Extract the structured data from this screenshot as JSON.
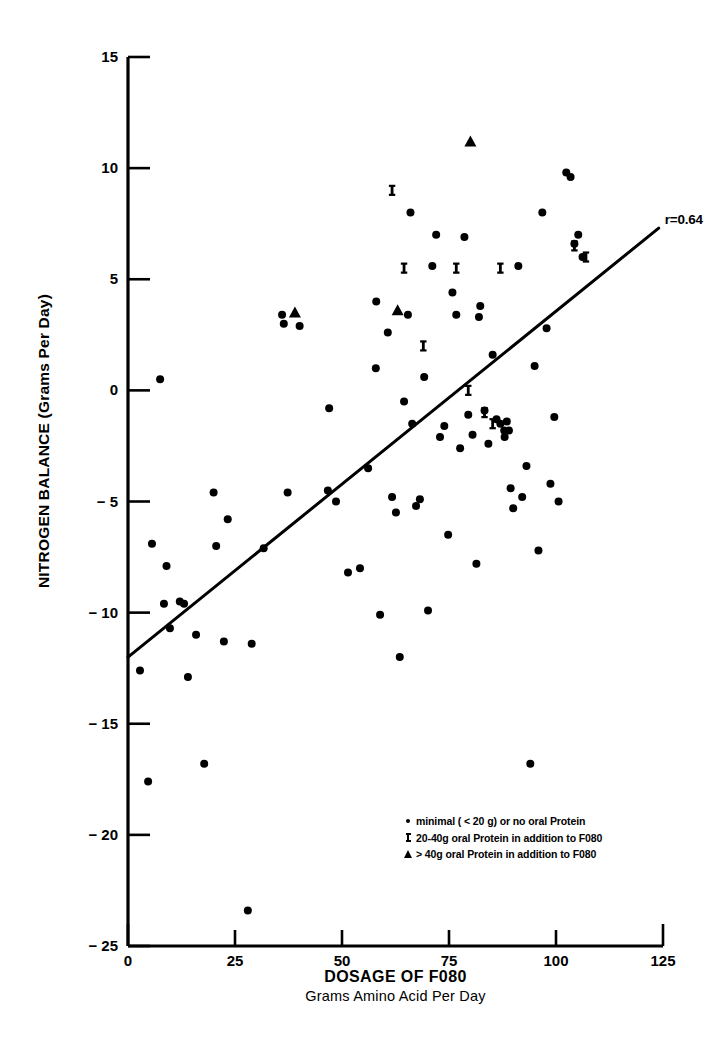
{
  "chart_data": {
    "type": "scatter",
    "title": "",
    "xlabel": "DOSAGE OF F080",
    "xlabel_sub": "Grams Amino Acid Per Day",
    "ylabel": "NITROGEN BALANCE (Grams Per Day)",
    "xlim": [
      0,
      125
    ],
    "ylim": [
      -25,
      15
    ],
    "xticks": [
      0,
      25,
      50,
      75,
      100,
      125
    ],
    "xtick_labels": [
      "0",
      "25",
      "50",
      "75",
      "100",
      "125"
    ],
    "yticks": [
      15,
      10,
      5,
      0,
      -5,
      -10,
      -15,
      -20,
      -25
    ],
    "ytick_labels": [
      "15",
      "10",
      "5",
      "0",
      "− 5",
      "− 10",
      "− 15",
      "− 20",
      "− 25"
    ],
    "grid": false,
    "legend_position": "inside-lower-right",
    "annotations": [
      {
        "name": "correlation",
        "text": "r=0.64",
        "x": 125,
        "y": 6.6
      }
    ],
    "trendline": {
      "name": "regression-line",
      "x0": 0,
      "y0": -12.0,
      "x1": 124,
      "y1": 7.3,
      "r": 0.64
    },
    "series": [
      {
        "name": "minimal ( < 20 g) or no oral Protein",
        "marker": "dot",
        "points": [
          [
            5.6,
            -6.9
          ],
          [
            2.8,
            -12.6
          ],
          [
            4.7,
            -17.6
          ],
          [
            7.5,
            0.5
          ],
          [
            8.4,
            -9.6
          ],
          [
            9.8,
            -10.7
          ],
          [
            12.1,
            -9.5
          ],
          [
            13.1,
            -9.6
          ],
          [
            15.9,
            -11.0
          ],
          [
            17.8,
            -16.8
          ],
          [
            14.0,
            -12.9
          ],
          [
            20.6,
            -7.0
          ],
          [
            22.4,
            -11.3
          ],
          [
            23.3,
            -5.8
          ],
          [
            28.0,
            -23.4
          ],
          [
            28.9,
            -11.4
          ],
          [
            31.7,
            -7.1
          ],
          [
            36.4,
            3.0
          ],
          [
            37.3,
            -4.6
          ],
          [
            40.1,
            2.9
          ],
          [
            46.7,
            -4.5
          ],
          [
            48.6,
            -5.0
          ],
          [
            51.4,
            -8.2
          ],
          [
            54.2,
            -8.0
          ],
          [
            56.1,
            -3.5
          ],
          [
            57.9,
            1.0
          ],
          [
            58.9,
            -10.1
          ],
          [
            60.7,
            2.6
          ],
          [
            61.7,
            -4.8
          ],
          [
            62.6,
            -5.5
          ],
          [
            63.5,
            -12.0
          ],
          [
            64.5,
            -0.5
          ],
          [
            65.4,
            3.4
          ],
          [
            66.4,
            -1.5
          ],
          [
            67.3,
            -5.2
          ],
          [
            68.2,
            -4.9
          ],
          [
            69.2,
            0.6
          ],
          [
            70.1,
            -9.9
          ],
          [
            71.1,
            5.6
          ],
          [
            72.0,
            7.0
          ],
          [
            72.9,
            -2.1
          ],
          [
            73.9,
            -1.6
          ],
          [
            74.8,
            -6.5
          ],
          [
            75.8,
            4.4
          ],
          [
            76.7,
            3.4
          ],
          [
            77.6,
            -2.6
          ],
          [
            78.6,
            6.9
          ],
          [
            79.5,
            -1.1
          ],
          [
            80.5,
            -2.0
          ],
          [
            81.4,
            -7.8
          ],
          [
            82.3,
            3.8
          ],
          [
            83.3,
            -0.9
          ],
          [
            84.2,
            -2.4
          ],
          [
            85.2,
            1.6
          ],
          [
            86.1,
            -1.3
          ],
          [
            87.0,
            -1.5
          ],
          [
            87.9,
            -1.8
          ],
          [
            88.0,
            -2.1
          ],
          [
            88.5,
            -1.4
          ],
          [
            89.0,
            -1.8
          ],
          [
            89.4,
            -4.4
          ],
          [
            90.0,
            -5.3
          ],
          [
            91.2,
            5.6
          ],
          [
            92.1,
            -4.8
          ],
          [
            93.1,
            -3.4
          ],
          [
            94.0,
            -16.8
          ],
          [
            95.0,
            1.1
          ],
          [
            95.9,
            -7.2
          ],
          [
            96.8,
            8.0
          ],
          [
            97.8,
            2.8
          ],
          [
            98.7,
            -4.2
          ],
          [
            99.6,
            -1.2
          ],
          [
            100.6,
            -5.0
          ],
          [
            102.4,
            9.8
          ],
          [
            103.4,
            9.6
          ],
          [
            104.3,
            6.6
          ],
          [
            105.2,
            7.0
          ],
          [
            106.2,
            6.0
          ],
          [
            58.0,
            4.0
          ],
          [
            47.0,
            -0.8
          ],
          [
            66.0,
            8.0
          ],
          [
            36.0,
            3.4
          ],
          [
            20.0,
            -4.6
          ],
          [
            9.0,
            -7.9
          ],
          [
            82.0,
            3.3
          ]
        ]
      },
      {
        "name": "20-40g oral Protein in addition to F080",
        "marker": "x",
        "points": [
          [
            61.7,
            9.0
          ],
          [
            64.5,
            5.5
          ],
          [
            76.7,
            5.5
          ],
          [
            79.5,
            0.0
          ],
          [
            83.3,
            -1.0
          ],
          [
            85.2,
            -1.5
          ],
          [
            87.0,
            5.5
          ],
          [
            104.3,
            6.5
          ],
          [
            107.0,
            6.0
          ],
          [
            69.0,
            2.0
          ]
        ]
      },
      {
        "name": "> 40g oral Protein in addition to F080",
        "marker": "triangle",
        "points": [
          [
            80.0,
            11.2
          ],
          [
            39.0,
            3.5
          ],
          [
            63.0,
            3.6
          ]
        ]
      }
    ]
  },
  "legend": {
    "items": [
      {
        "marker": "dot",
        "label": "minimal ( < 20 g) or no oral Protein"
      },
      {
        "marker": "x",
        "label": "20-40g oral Protein in addition to F080"
      },
      {
        "marker": "triangle",
        "label": "> 40g oral Protein in addition to F080"
      }
    ]
  }
}
